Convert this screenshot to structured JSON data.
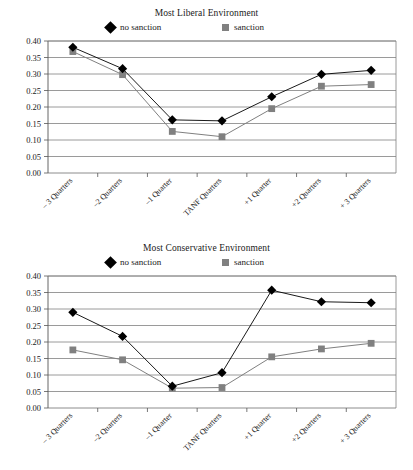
{
  "figure": {
    "panels": [
      "liberal",
      "conservative"
    ]
  },
  "legend": {
    "entries": [
      {
        "label": "no sanction",
        "marker": "diamond-marker-icon",
        "color": "#000000"
      },
      {
        "label": "sanction",
        "marker": "square-marker-icon",
        "color": "#808080"
      }
    ]
  },
  "axis": {
    "ytick_labels": [
      "0.40",
      "0.35",
      "0.30",
      "0.25",
      "0.20",
      "0.15",
      "0.10",
      "0.05",
      "0.00"
    ],
    "xtick_labels": [
      "– 3 Quarters",
      "–2 Quarters",
      "–1 Quarter",
      "TANF Quarters",
      "+1 Quarter",
      "+2 Quarters",
      "+ 3 Quarters"
    ]
  },
  "chart_data": [
    {
      "type": "line",
      "title": "Most Liberal Environment",
      "xlabel": "",
      "ylabel": "",
      "ylim": [
        0.0,
        0.4
      ],
      "ytick_step": 0.05,
      "grid": true,
      "legend_position": "top",
      "categories": [
        "– 3 Quarters",
        "–2 Quarters",
        "–1 Quarter",
        "TANF Quarters",
        "+1 Quarter",
        "+2 Quarters",
        "+ 3 Quarters"
      ],
      "series": [
        {
          "name": "no sanction",
          "color": "#000000",
          "marker": "diamond",
          "values": [
            0.381,
            0.316,
            0.161,
            0.158,
            0.231,
            0.299,
            0.311
          ]
        },
        {
          "name": "sanction",
          "color": "#808080",
          "marker": "square",
          "values": [
            0.368,
            0.298,
            0.126,
            0.11,
            0.195,
            0.263,
            0.268
          ]
        }
      ]
    },
    {
      "type": "line",
      "title": "Most Conservative Environment",
      "xlabel": "",
      "ylabel": "",
      "ylim": [
        0.0,
        0.4
      ],
      "ytick_step": 0.05,
      "grid": true,
      "legend_position": "top",
      "categories": [
        "– 3 Quarters",
        "–2 Quarters",
        "–1 Quarter",
        "TANF Quarters",
        "+1 Quarter",
        "+2 Quarters",
        "+ 3 Quarters"
      ],
      "series": [
        {
          "name": "no sanction",
          "color": "#000000",
          "marker": "diamond",
          "values": [
            0.29,
            0.217,
            0.066,
            0.107,
            0.357,
            0.322,
            0.319
          ]
        },
        {
          "name": "sanction",
          "color": "#808080",
          "marker": "square",
          "values": [
            0.176,
            0.146,
            0.06,
            0.062,
            0.155,
            0.179,
            0.196
          ]
        }
      ]
    }
  ]
}
